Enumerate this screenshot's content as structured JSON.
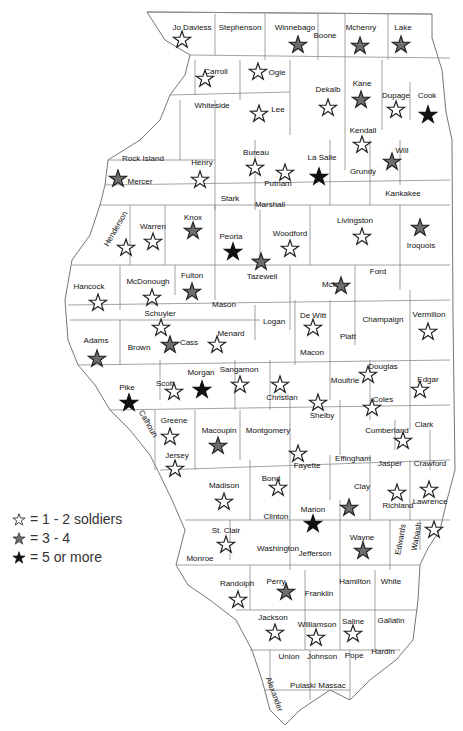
{
  "legend": {
    "items": [
      {
        "key": "light",
        "label": "= 1 - 2 soldiers"
      },
      {
        "key": "medium",
        "label": "= 3 - 4"
      },
      {
        "key": "dark",
        "label": "= 5 or more"
      }
    ]
  },
  "colors": {
    "light": "#ffffff",
    "medium": "#6e6e6e",
    "dark": "#111111",
    "stroke": "#222222"
  },
  "counties": [
    {
      "name": "Jo Daviess",
      "lx": 192,
      "ly": 30,
      "sx": 182,
      "sy": 40,
      "level": "light"
    },
    {
      "name": "Stephenson",
      "lx": 240,
      "ly": 30
    },
    {
      "name": "Winnebago",
      "lx": 295,
      "ly": 30,
      "sx": 298,
      "sy": 45,
      "level": "medium"
    },
    {
      "name": "Boone",
      "lx": 325,
      "ly": 38
    },
    {
      "name": "Mchenry",
      "lx": 361,
      "ly": 30,
      "sx": 360,
      "sy": 46,
      "level": "medium"
    },
    {
      "name": "Lake",
      "lx": 403,
      "ly": 30,
      "sx": 401,
      "sy": 45,
      "level": "medium"
    },
    {
      "name": "Carroll",
      "lx": 216,
      "ly": 74,
      "sx": 205,
      "sy": 79,
      "level": "light"
    },
    {
      "name": "Ogle",
      "lx": 277,
      "ly": 75,
      "sx": 258,
      "sy": 72,
      "level": "light"
    },
    {
      "name": "Whiteside",
      "lx": 212,
      "ly": 108
    },
    {
      "name": "Lee",
      "lx": 278,
      "ly": 112,
      "sx": 259,
      "sy": 114,
      "level": "light"
    },
    {
      "name": "Dekalb",
      "lx": 328,
      "ly": 92,
      "sx": 328,
      "sy": 108,
      "level": "light"
    },
    {
      "name": "Kane",
      "lx": 362,
      "ly": 86,
      "sx": 361,
      "sy": 100,
      "level": "medium"
    },
    {
      "name": "Dupage",
      "lx": 396,
      "ly": 98,
      "sx": 396,
      "sy": 110,
      "level": "light"
    },
    {
      "name": "Cook",
      "lx": 427,
      "ly": 98,
      "sx": 428,
      "sy": 115,
      "level": "dark"
    },
    {
      "name": "Kendall",
      "lx": 363,
      "ly": 133,
      "sx": 362,
      "sy": 145,
      "level": "light"
    },
    {
      "name": "Will",
      "lx": 402,
      "ly": 153,
      "sx": 392,
      "sy": 162,
      "level": "medium"
    },
    {
      "name": "Rock Island",
      "lx": 143,
      "ly": 161
    },
    {
      "name": "Mercer",
      "lx": 140,
      "ly": 184,
      "sx": 118,
      "sy": 179,
      "level": "medium"
    },
    {
      "name": "Henry",
      "lx": 202,
      "ly": 165,
      "sx": 200,
      "sy": 180,
      "level": "light"
    },
    {
      "name": "Bureau",
      "lx": 256,
      "ly": 155,
      "sx": 255,
      "sy": 168,
      "level": "light"
    },
    {
      "name": "Putnam",
      "lx": 278,
      "ly": 186,
      "sx": 285,
      "sy": 173,
      "level": "light"
    },
    {
      "name": "La Salle",
      "lx": 322,
      "ly": 160,
      "sx": 319,
      "sy": 177,
      "level": "dark"
    },
    {
      "name": "Grundy",
      "lx": 363,
      "ly": 174
    },
    {
      "name": "Kankakee",
      "lx": 403,
      "ly": 196
    },
    {
      "name": "Stark",
      "lx": 230,
      "ly": 201
    },
    {
      "name": "Marshall",
      "lx": 270,
      "ly": 207
    },
    {
      "name": "Henderson",
      "lx": 118,
      "ly": 230,
      "rot": -60,
      "sx": 126,
      "sy": 248,
      "level": "light"
    },
    {
      "name": "Warren",
      "lx": 153,
      "ly": 229,
      "sx": 153,
      "sy": 242,
      "level": "light"
    },
    {
      "name": "Knox",
      "lx": 193,
      "ly": 220,
      "sx": 193,
      "sy": 231,
      "level": "medium"
    },
    {
      "name": "Peoria",
      "lx": 231,
      "ly": 239,
      "sx": 233,
      "sy": 252,
      "level": "dark"
    },
    {
      "name": "Woodford",
      "lx": 290,
      "ly": 236,
      "sx": 290,
      "sy": 249,
      "level": "light"
    },
    {
      "name": "Livingston",
      "lx": 355,
      "ly": 223,
      "sx": 362,
      "sy": 237,
      "level": "light"
    },
    {
      "name": "Iroquois",
      "lx": 421,
      "ly": 248,
      "sx": 420,
      "sy": 228,
      "level": "medium"
    },
    {
      "name": "Tazewell",
      "lx": 262,
      "ly": 279,
      "sx": 261,
      "sy": 262,
      "level": "medium"
    },
    {
      "name": "Ford",
      "lx": 378,
      "ly": 274
    },
    {
      "name": "Hancock",
      "lx": 89,
      "ly": 289,
      "sx": 98,
      "sy": 303,
      "level": "light"
    },
    {
      "name": "McDonough",
      "lx": 148,
      "ly": 284,
      "sx": 152,
      "sy": 298,
      "level": "light"
    },
    {
      "name": "Fulton",
      "lx": 192,
      "ly": 278,
      "sx": 192,
      "sy": 292,
      "level": "medium"
    },
    {
      "name": "Mclean",
      "lx": 335,
      "ly": 287,
      "sx": 341,
      "sy": 286,
      "level": "medium"
    },
    {
      "name": "Mason",
      "lx": 224,
      "ly": 307
    },
    {
      "name": "Champaign",
      "lx": 383,
      "ly": 322
    },
    {
      "name": "Vermilion",
      "lx": 429,
      "ly": 317,
      "sx": 428,
      "sy": 332,
      "level": "light"
    },
    {
      "name": "Schuyler",
      "lx": 160,
      "ly": 316,
      "sx": 161,
      "sy": 328,
      "level": "light"
    },
    {
      "name": "Logan",
      "lx": 274,
      "ly": 324
    },
    {
      "name": "De Witt",
      "lx": 313,
      "ly": 318,
      "sx": 313,
      "sy": 328,
      "level": "light"
    },
    {
      "name": "Platt",
      "lx": 348,
      "ly": 339
    },
    {
      "name": "Menard",
      "lx": 231,
      "ly": 336,
      "sx": 217,
      "sy": 345,
      "level": "light"
    },
    {
      "name": "Cass",
      "lx": 189,
      "ly": 345,
      "sx": 170,
      "sy": 345,
      "level": "medium"
    },
    {
      "name": "Adams",
      "lx": 96,
      "ly": 343,
      "sx": 97,
      "sy": 359,
      "level": "medium"
    },
    {
      "name": "Brown",
      "lx": 139,
      "ly": 350
    },
    {
      "name": "Macon",
      "lx": 312,
      "ly": 355
    },
    {
      "name": "Douglas",
      "lx": 383,
      "ly": 369,
      "sx": 368,
      "sy": 375,
      "level": "light"
    },
    {
      "name": "Edgar",
      "lx": 428,
      "ly": 382,
      "sx": 420,
      "sy": 390,
      "level": "light"
    },
    {
      "name": "Sangamon",
      "lx": 239,
      "ly": 372,
      "sx": 240,
      "sy": 385,
      "level": "light"
    },
    {
      "name": "Morgan",
      "lx": 201,
      "ly": 375,
      "sx": 202,
      "sy": 390,
      "level": "dark"
    },
    {
      "name": "Scott",
      "lx": 165,
      "ly": 386,
      "sx": 174,
      "sy": 392,
      "level": "light"
    },
    {
      "name": "Moultrie",
      "lx": 345,
      "ly": 383
    },
    {
      "name": "Pike",
      "lx": 127,
      "ly": 390,
      "sx": 129,
      "sy": 403,
      "level": "dark"
    },
    {
      "name": "Christian",
      "lx": 282,
      "ly": 400,
      "sx": 280,
      "sy": 385,
      "level": "light"
    },
    {
      "name": "Shelby",
      "lx": 322,
      "ly": 418,
      "sx": 318,
      "sy": 403,
      "level": "light"
    },
    {
      "name": "Coles",
      "lx": 383,
      "ly": 402,
      "sx": 372,
      "sy": 408,
      "level": "light"
    },
    {
      "name": "Calhoun",
      "lx": 146,
      "ly": 425,
      "rot": 60
    },
    {
      "name": "Greene",
      "lx": 174,
      "ly": 423,
      "sx": 170,
      "sy": 437,
      "level": "light"
    },
    {
      "name": "Macoupin",
      "lx": 219,
      "ly": 433,
      "sx": 218,
      "sy": 446,
      "level": "medium"
    },
    {
      "name": "Montgomery",
      "lx": 268,
      "ly": 433
    },
    {
      "name": "Cumberland",
      "lx": 387,
      "ly": 433,
      "sx": 403,
      "sy": 441,
      "level": "light"
    },
    {
      "name": "Clark",
      "lx": 424,
      "ly": 427
    },
    {
      "name": "Jersey",
      "lx": 177,
      "ly": 458,
      "sx": 175,
      "sy": 469,
      "level": "light"
    },
    {
      "name": "Fayette",
      "lx": 307,
      "ly": 468,
      "sx": 298,
      "sy": 454,
      "level": "light"
    },
    {
      "name": "Effingham",
      "lx": 353,
      "ly": 461
    },
    {
      "name": "Jasper",
      "lx": 390,
      "ly": 466
    },
    {
      "name": "Crawford",
      "lx": 430,
      "ly": 466
    },
    {
      "name": "Bond",
      "lx": 271,
      "ly": 481,
      "sx": 278,
      "sy": 488,
      "level": "light"
    },
    {
      "name": "Madison",
      "lx": 224,
      "ly": 488,
      "sx": 224,
      "sy": 502,
      "level": "light"
    },
    {
      "name": "Clay",
      "lx": 362,
      "ly": 489,
      "sx": 349,
      "sy": 508,
      "level": "medium"
    },
    {
      "name": "Richland",
      "lx": 398,
      "ly": 508,
      "sx": 397,
      "sy": 493,
      "level": "light"
    },
    {
      "name": "Lawrence",
      "lx": 430,
      "ly": 504,
      "sx": 429,
      "sy": 490,
      "level": "light"
    },
    {
      "name": "Marion",
      "lx": 313,
      "ly": 512,
      "sx": 313,
      "sy": 524,
      "level": "dark"
    },
    {
      "name": "Clinton",
      "lx": 276,
      "ly": 519
    },
    {
      "name": "Edwards",
      "lx": 403,
      "ly": 540,
      "rot": -80
    },
    {
      "name": "Wabash",
      "lx": 419,
      "ly": 537,
      "rot": -80,
      "sx": 434,
      "sy": 530,
      "level": "light"
    },
    {
      "name": "St. Clair",
      "lx": 226,
      "ly": 533,
      "sx": 226,
      "sy": 545,
      "level": "light"
    },
    {
      "name": "Wayne",
      "lx": 362,
      "ly": 540,
      "sx": 363,
      "sy": 551,
      "level": "medium"
    },
    {
      "name": "Washington",
      "lx": 278,
      "ly": 551
    },
    {
      "name": "Jefferson",
      "lx": 315,
      "ly": 556
    },
    {
      "name": "Monroe",
      "lx": 200,
      "ly": 561
    },
    {
      "name": "Randolph",
      "lx": 237,
      "ly": 586,
      "sx": 238,
      "sy": 600,
      "level": "light"
    },
    {
      "name": "Perry",
      "lx": 276,
      "ly": 584,
      "sx": 286,
      "sy": 592,
      "level": "medium"
    },
    {
      "name": "Hamilton",
      "lx": 355,
      "ly": 584
    },
    {
      "name": "White",
      "lx": 391,
      "ly": 584
    },
    {
      "name": "Franklin",
      "lx": 319,
      "ly": 596
    },
    {
      "name": "Jackson",
      "lx": 273,
      "ly": 620,
      "sx": 275,
      "sy": 633,
      "level": "light"
    },
    {
      "name": "Williamson",
      "lx": 317,
      "ly": 627,
      "sx": 316,
      "sy": 638,
      "level": "light"
    },
    {
      "name": "Saline",
      "lx": 353,
      "ly": 624,
      "sx": 353,
      "sy": 634,
      "level": "light"
    },
    {
      "name": "Gallatin",
      "lx": 391,
      "ly": 623
    },
    {
      "name": "Union",
      "lx": 289,
      "ly": 659
    },
    {
      "name": "Johnson",
      "lx": 322,
      "ly": 659
    },
    {
      "name": "Pope",
      "lx": 354,
      "ly": 658
    },
    {
      "name": "Hardin",
      "lx": 383,
      "ly": 654
    },
    {
      "name": "Alexander",
      "lx": 272,
      "ly": 695,
      "rot": 70
    },
    {
      "name": "Pulaski",
      "lx": 303,
      "ly": 688
    },
    {
      "name": "Massac",
      "lx": 332,
      "ly": 688
    }
  ]
}
